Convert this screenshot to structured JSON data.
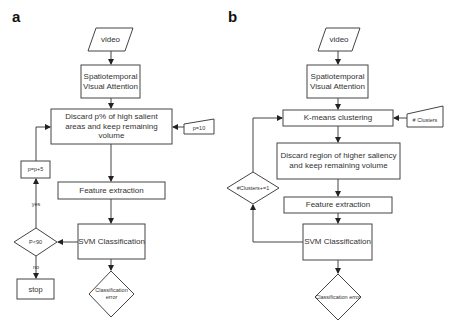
{
  "panel_a": {
    "label": "a",
    "video": "video",
    "attention": "Spatiotemporal Visual Attention",
    "discard": "Discard p% of high salient areas and keep remaining volume",
    "param_input": "p=10",
    "update": "p=p+5",
    "feature": "Feature extraction",
    "svm": "SVM Classification",
    "decision": "P<90",
    "yes": "yes",
    "no": "no",
    "stop": "stop",
    "error": "Classification error"
  },
  "panel_b": {
    "label": "b",
    "video": "video",
    "attention": "Spatiotemporal Visual Attention",
    "kmeans": "K-means clustering",
    "param_input": "# Clusters",
    "discard": "Discard region of higher saliency and keep remaining volume",
    "update": "#Clusters+=1",
    "feature": "Feature extraction",
    "svm": "SVM Classification",
    "error": "Classification error"
  },
  "colors": {
    "stroke": "#444444",
    "text": "#333333"
  }
}
